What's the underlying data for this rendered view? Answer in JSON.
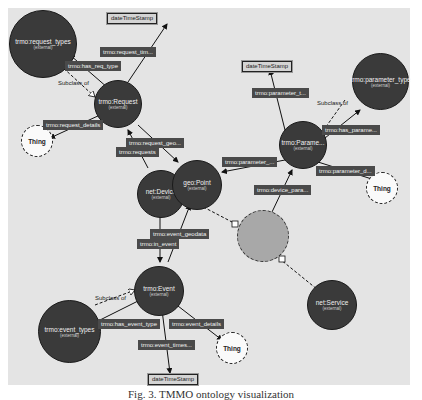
{
  "nodes": {
    "request_types": {
      "label": "trmo:request_types",
      "sub": "(external)"
    },
    "request": {
      "label": "trmo:Request",
      "sub": "(external)"
    },
    "parameter_type": {
      "label": "trmo:parameter_type",
      "sub": "(external)"
    },
    "parameter": {
      "label": "trmo:Parame...",
      "sub": "(external)"
    },
    "geopoint": {
      "label": "geo:Point",
      "sub": "(external)"
    },
    "device": {
      "label": "net:Device",
      "sub": "(external)"
    },
    "event": {
      "label": "trmo:Event",
      "sub": "(external)"
    },
    "event_types": {
      "label": "trmo:event_types",
      "sub": "(external)"
    },
    "service": {
      "label": "net:Service",
      "sub": "(external)"
    }
  },
  "things": {
    "thing1": "Thing",
    "thing2": "Thing",
    "thing3": "Thing"
  },
  "datatypes": {
    "dt1": "dateTimeStamp",
    "dt2": "dateTimeStamp",
    "dt3": "dateTimeStamp"
  },
  "properties": {
    "request_tim": "trmo:request_tim...",
    "has_req_type": "trmo:has_req_type",
    "request_details": "trmo:request_details",
    "request_geo": "trmo:request_geo...",
    "requests": "trmo:requests",
    "parameter_t": "trmo:parameter_t...",
    "has_parame": "trmo:has_parame...",
    "parameter_left": "trmo:parameter_...",
    "parameter_d": "trmo:parameter_d...",
    "device_para": "trmo:device_para...",
    "event_geodata": "trmo:event_geodata",
    "in_event": "trmo:in_event",
    "has_event_type": "trmo:has_event_type",
    "event_details": "trmo:event_details",
    "event_times": "trmo:event_times..."
  },
  "subclass": {
    "s1": "Subclass of",
    "s2": "Subclass of",
    "s3": "Subclass of"
  },
  "caption": "Fig. 3. TMMO ontology visualization"
}
